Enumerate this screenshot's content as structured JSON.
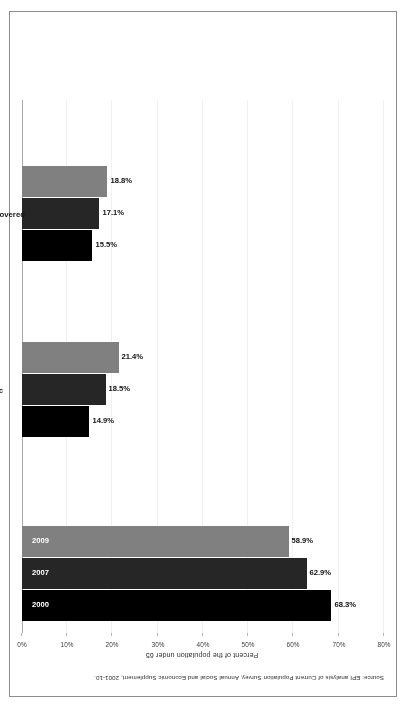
{
  "figure": {
    "source_note": "Source: EPI analysis of Current Population Survey, Annual Social and Economic Supplement, 2001-10."
  },
  "chart_data": {
    "type": "bar",
    "title": "",
    "subtitle": "",
    "xlabel": "",
    "ylabel": "Percent of the population under 65",
    "ylim": [
      0,
      80
    ],
    "grid": true,
    "legend_position": "in-bar",
    "orientation": "vertical",
    "categories": [
      "ESI",
      "Public",
      "Not covered"
    ],
    "tick_labels": [
      "0%",
      "10%",
      "20%",
      "30%",
      "40%",
      "50%",
      "60%",
      "70%",
      "80%"
    ],
    "tick_values": [
      0,
      10,
      20,
      30,
      40,
      50,
      60,
      70,
      80
    ],
    "series": [
      {
        "name": "2000",
        "color": "#000000",
        "values": [
          68.3,
          14.9,
          15.5
        ],
        "value_labels": [
          "68.3%",
          "14.9%",
          "15.5%"
        ]
      },
      {
        "name": "2007",
        "color": "#262626",
        "values": [
          62.9,
          18.5,
          17.1
        ],
        "value_labels": [
          "62.9%",
          "18.5%",
          "17.1%"
        ]
      },
      {
        "name": "2009",
        "color": "#808080",
        "values": [
          58.9,
          21.4,
          18.8
        ],
        "value_labels": [
          "58.9%",
          "21.4%",
          "18.8%"
        ]
      }
    ]
  }
}
